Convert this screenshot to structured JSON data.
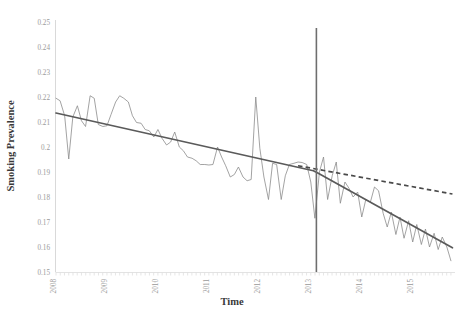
{
  "chart_data": {
    "type": "line",
    "title": "",
    "xlabel": "Time",
    "ylabel": "Smoking Prevalence",
    "xlim": [
      2008.0,
      2015.83
    ],
    "ylim": [
      0.15,
      0.25
    ],
    "ytick_labels": [
      "0.25",
      "0.24",
      "0.23",
      "0.22",
      "0.21",
      "0.2",
      "0.19",
      "0.18",
      "0.17",
      "0.16",
      "0.15"
    ],
    "ytick_values": [
      0.25,
      0.24,
      0.23,
      0.22,
      0.21,
      0.2,
      0.19,
      0.18,
      0.17,
      0.16,
      0.15
    ],
    "xtick_labels": [
      "2008",
      "2009",
      "2010",
      "2011",
      "2012",
      "2013",
      "2014",
      "2015"
    ],
    "xtick_values": [
      2008,
      2009,
      2010,
      2011,
      2012,
      2013,
      2014,
      2015
    ],
    "grid": false,
    "legend": "none",
    "annotations": [
      {
        "name": "intervention-line",
        "type": "vline",
        "x": 2013.11,
        "label": ""
      }
    ],
    "series": [
      {
        "name": "observed",
        "style": "solid-thin",
        "color": "#8c8c8c",
        "x": [
          2008.0,
          2008.08,
          2008.17,
          2008.25,
          2008.33,
          2008.42,
          2008.5,
          2008.58,
          2008.67,
          2008.75,
          2008.83,
          2008.92,
          2009.0,
          2009.08,
          2009.17,
          2009.25,
          2009.33,
          2009.42,
          2009.5,
          2009.58,
          2009.67,
          2009.75,
          2009.83,
          2009.92,
          2010.0,
          2010.08,
          2010.17,
          2010.25,
          2010.33,
          2010.42,
          2010.5,
          2010.58,
          2010.67,
          2010.75,
          2010.83,
          2010.92,
          2011.0,
          2011.08,
          2011.17,
          2011.25,
          2011.33,
          2011.42,
          2011.5,
          2011.58,
          2011.67,
          2011.75,
          2011.83,
          2011.92,
          2012.0,
          2012.08,
          2012.17,
          2012.25,
          2012.33,
          2012.42,
          2012.5,
          2012.58,
          2012.67,
          2012.75,
          2012.83,
          2012.92,
          2013.0,
          2013.08,
          2013.17,
          2013.25,
          2013.33,
          2013.42,
          2013.5,
          2013.58,
          2013.67,
          2013.75,
          2013.83,
          2013.92,
          2014.0,
          2014.08,
          2014.17,
          2014.25,
          2014.33,
          2014.42,
          2014.5,
          2014.58,
          2014.67,
          2014.75,
          2014.83,
          2014.92,
          2015.0,
          2015.08,
          2015.17,
          2015.25,
          2015.33,
          2015.42,
          2015.5,
          2015.58,
          2015.67,
          2015.75
        ],
        "y": [
          0.2195,
          0.2185,
          0.2125,
          0.1952,
          0.212,
          0.2165,
          0.2105,
          0.2082,
          0.2205,
          0.2195,
          0.209,
          0.2082,
          0.2085,
          0.213,
          0.218,
          0.2205,
          0.2195,
          0.218,
          0.2125,
          0.2098,
          0.2095,
          0.207,
          0.2065,
          0.204,
          0.207,
          0.2035,
          0.2008,
          0.202,
          0.206,
          0.2,
          0.1985,
          0.196,
          0.1955,
          0.1945,
          0.193,
          0.193,
          0.1928,
          0.193,
          0.2,
          0.196,
          0.1925,
          0.188,
          0.189,
          0.192,
          0.188,
          0.1865,
          0.187,
          0.22,
          0.1995,
          0.188,
          0.179,
          0.1935,
          0.193,
          0.179,
          0.1885,
          0.193,
          0.1935,
          0.194,
          0.1938,
          0.193,
          0.186,
          0.1715,
          0.19,
          0.196,
          0.179,
          0.1885,
          0.194,
          0.1775,
          0.186,
          0.1835,
          0.18,
          0.182,
          0.172,
          0.179,
          0.178,
          0.184,
          0.1825,
          0.1735,
          0.168,
          0.174,
          0.165,
          0.172,
          0.1635,
          0.1705,
          0.162,
          0.169,
          0.161,
          0.1672,
          0.16,
          0.1655,
          0.159,
          0.164,
          0.16,
          0.1545
        ]
      },
      {
        "name": "fitted-trend",
        "style": "solid-thick",
        "color": "#5a5a5a",
        "x": [
          2008.0,
          2013.05,
          2013.12,
          2015.78
        ],
        "y": [
          0.2136,
          0.1905,
          0.1898,
          0.1597
        ]
      },
      {
        "name": "counterfactual-trend",
        "style": "dashed",
        "color": "#4a4a4a",
        "x": [
          2012.75,
          2015.78
        ],
        "y": [
          0.1925,
          0.1812
        ]
      }
    ]
  },
  "axis": {
    "y_title": "Smoking Prevalence",
    "x_title": "Time"
  },
  "colors": {
    "observed_line": "#8c8c8c",
    "trend_line": "#5a5a5a",
    "counterfactual_line": "#4a4a4a",
    "intervention_line": "#6e6e6e",
    "axis": "#d9d9d9",
    "tick_text": "#9a9a9a",
    "title_text": "#3a3a3a"
  }
}
